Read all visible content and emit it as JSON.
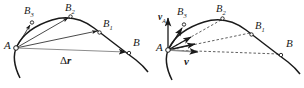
{
  "figure": {
    "background_color": "#ffffff",
    "stroke_color": "#1a1a1a",
    "panels": [
      {
        "name": "displacement-panel",
        "point_a_label": "A",
        "point_b_label": "B",
        "intermediate_labels": [
          "B",
          "B",
          "B"
        ],
        "intermediate_subscripts": [
          "1",
          "2",
          "3"
        ],
        "displacement_label": "Δ",
        "displacement_vector_symbol": "r"
      },
      {
        "name": "velocity-panel",
        "point_a_label": "A",
        "point_b_label": "B",
        "intermediate_labels": [
          "B",
          "B",
          "B"
        ],
        "intermediate_subscripts": [
          "1",
          "2",
          "3"
        ],
        "velocity_a_symbol": "v",
        "velocity_a_subscript": "A",
        "velocity_limit_symbol": "v"
      }
    ]
  }
}
